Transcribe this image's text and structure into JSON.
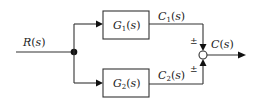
{
  "diagram": {
    "type": "block-diagram",
    "input": {
      "name": "R",
      "arg": "s"
    },
    "output": {
      "name": "C",
      "arg": "s"
    },
    "blocks": [
      {
        "name": "G",
        "sub": "1",
        "arg": "s"
      },
      {
        "name": "G",
        "sub": "2",
        "arg": "s"
      }
    ],
    "signals": [
      {
        "name": "C",
        "sub": "1",
        "arg": "s"
      },
      {
        "name": "C",
        "sub": "2",
        "arg": "s"
      }
    ],
    "summing_junction": {
      "signs": [
        "±",
        "±"
      ]
    }
  }
}
